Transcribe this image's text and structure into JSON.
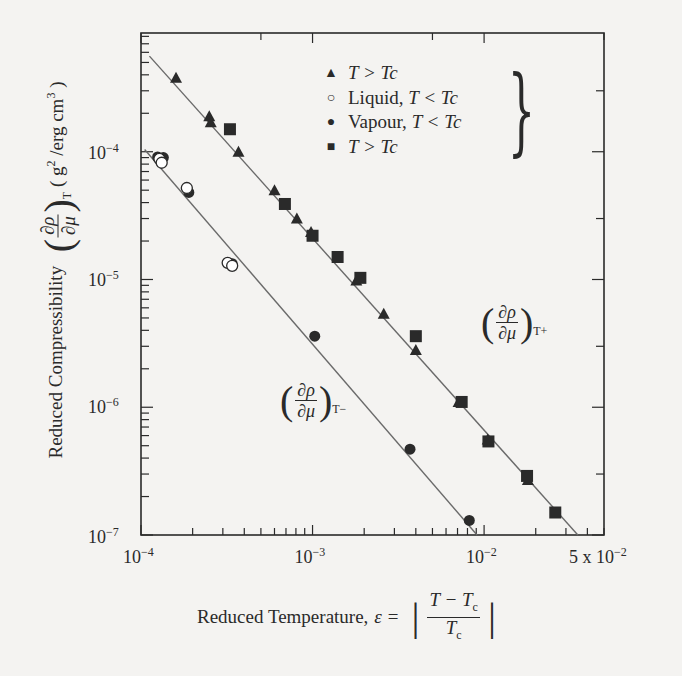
{
  "chart_data": {
    "type": "scatter",
    "scale": {
      "x": "log",
      "y": "log"
    },
    "xlabel": "Reduced Temperature, ε = |(T − Tc)/Tc|",
    "ylabel": "Reduced Compressibility (∂ρ/∂μ)_T (g²/erg cm³)",
    "xlim": [
      0.0001,
      0.05
    ],
    "ylim": [
      1e-07,
      0.00085
    ],
    "grid": false,
    "legend_position": "upper-right-inside",
    "x_ticks": [
      {
        "value": 0.0001,
        "label_base": "10",
        "label_exp": "−4"
      },
      {
        "value": 0.001,
        "label_base": "10",
        "label_exp": "−3"
      },
      {
        "value": 0.01,
        "label_base": "10",
        "label_exp": "−2"
      },
      {
        "value": 0.05,
        "label_base": "5 x 10",
        "label_exp": "−2"
      }
    ],
    "y_ticks": [
      {
        "value": 0.0001,
        "label_base": "10",
        "label_exp": "−4"
      },
      {
        "value": 1e-05,
        "label_base": "10",
        "label_exp": "−5"
      },
      {
        "value": 1e-06,
        "label_base": "10",
        "label_exp": "−6"
      },
      {
        "value": 1e-07,
        "label_base": "10",
        "label_exp": "−7"
      }
    ],
    "legend": [
      {
        "marker": "triangle",
        "prefix": "",
        "label": "T > Tc"
      },
      {
        "marker": "open-circle",
        "prefix": "Liquid, ",
        "label": "T < Tc"
      },
      {
        "marker": "filled-circle",
        "prefix": "Vapour, ",
        "label": "T < Tc"
      },
      {
        "marker": "square",
        "prefix": "",
        "label": "T > Tc"
      }
    ],
    "series": [
      {
        "name": "T > Tc (triangle)",
        "marker": "triangle",
        "x": [
          0.00016,
          0.00025,
          0.000255,
          0.00037,
          0.0006,
          0.00081,
          0.00098,
          0.0018,
          0.0026,
          0.004,
          0.0071,
          0.0105,
          0.018
        ],
        "y": [
          0.00038,
          0.00019,
          0.00017,
          0.0001,
          5e-05,
          3e-05,
          2.35e-05,
          9.8e-06,
          5.4e-06,
          2.8e-06,
          1.1e-06,
          5.6e-07,
          2.7e-07
        ]
      },
      {
        "name": "T > Tc (square)",
        "marker": "square",
        "x": [
          0.00033,
          0.00069,
          0.001,
          0.0014,
          0.0019,
          0.004,
          0.0074,
          0.0106,
          0.0178,
          0.026
        ],
        "y": [
          0.00015,
          3.9e-05,
          2.2e-05,
          1.5e-05,
          1.03e-05,
          3.6e-06,
          1.1e-06,
          5.4e-07,
          2.9e-07,
          1.5e-07
        ]
      },
      {
        "name": "Liquid, T < Tc",
        "marker": "open-circle",
        "x": [
          0.000128,
          0.000132,
          0.000185,
          0.00032,
          0.00034
        ],
        "y": [
          8.8e-05,
          8.2e-05,
          5.2e-05,
          1.35e-05,
          1.28e-05
        ]
      },
      {
        "name": "Vapour, T < Tc",
        "marker": "filled-circle",
        "x": [
          0.000125,
          0.000135,
          0.00019,
          0.00034,
          0.00103,
          0.0037,
          0.0082
        ],
        "y": [
          9.1e-05,
          9e-05,
          4.8e-05,
          1.33e-05,
          3.6e-06,
          4.7e-07,
          1.3e-07
        ]
      }
    ],
    "fit_lines": [
      {
        "name": "(∂ρ/∂μ)_T+",
        "x": [
          0.000112,
          0.0352
        ],
        "y": [
          0.00056,
          1e-07
        ]
      },
      {
        "name": "(∂ρ/∂μ)_T−",
        "x": [
          0.000105,
          0.0091
        ],
        "y": [
          0.000104,
          1e-07
        ]
      }
    ],
    "annotations": [
      {
        "text": "(∂ρ/∂μ)_T+",
        "near": "upper fit line"
      },
      {
        "text": "(∂ρ/∂μ)_T−",
        "near": "lower fit line"
      }
    ]
  },
  "labels": {
    "ylabel_main": "Reduced Compressibility",
    "ylabel_sub": "T",
    "ylabel_units_pre": "( g",
    "ylabel_units_mid": " /erg cm",
    "ylabel_units_post": " )",
    "sq": "2",
    "cube": "3",
    "xlabel_main": "Reduced Temperature,",
    "xlabel_eps": "ε =",
    "xlabel_num": "T − T",
    "xlabel_den": "T",
    "xlabel_c": "c",
    "frac_num": "∂ρ",
    "frac_den": "∂μ",
    "ann_plus_sub": "T+",
    "ann_minus_sub": "T−",
    "paren_l": "(",
    "paren_r": ")",
    "abs_bar": "|",
    "brace": "}"
  },
  "legend_markers": {
    "triangle": "▲",
    "open-circle": "○",
    "filled-circle": "●",
    "square": "■"
  },
  "colors": {
    "ink": "#2a2a2a",
    "line": "#6a6a6a",
    "background": "#f4f3f1"
  }
}
